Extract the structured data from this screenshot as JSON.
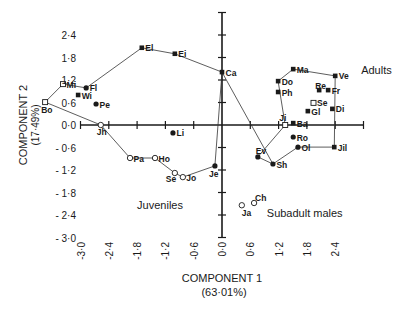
{
  "chart_data": {
    "type": "scatter",
    "title": "",
    "xlabel": "COMPONENT 1",
    "xlabel_sub": "(63·01%)",
    "ylabel": "COMPONENT 2",
    "ylabel_sub": "(17·49%)",
    "xlim": [
      -3.0,
      3.0
    ],
    "ylim": [
      -3.0,
      3.0
    ],
    "x_ticks": [
      -3.0,
      -2.4,
      -1.8,
      -1.2,
      -0.6,
      0.0,
      0.6,
      1.2,
      1.8,
      2.4
    ],
    "x_tick_labels": [
      "-3·0",
      "-2·4",
      "-1·8",
      "-1·2",
      "-0·6",
      "0·0",
      "0·6",
      "1·2",
      "1·8",
      "2·4"
    ],
    "y_ticks": [
      2.4,
      1.8,
      1.2,
      0.6,
      0.0,
      -0.6,
      -1.2,
      -1.8,
      -2.4,
      -3.0
    ],
    "y_tick_labels": [
      "2·4",
      "1·8",
      "1·2",
      "0·6",
      "0·0",
      "- 0·6",
      "- 1·2",
      "- 1·8",
      "- 2·4",
      "- 3·0"
    ],
    "grid": false,
    "legend": "none",
    "group_labels": [
      {
        "text": "Adults",
        "x": 2.95,
        "y": 1.35
      },
      {
        "text": "Juveniles",
        "x": -1.8,
        "y": -2.25
      },
      {
        "text": "Subadult males",
        "x": 0.95,
        "y": -2.45
      }
    ],
    "points": [
      {
        "label": "Bo",
        "x": -3.75,
        "y": 0.61,
        "marker": "open-square",
        "group": "Juveniles"
      },
      {
        "label": "Mi",
        "x": -3.37,
        "y": 1.09,
        "marker": "open-square",
        "group": "Adults"
      },
      {
        "label": "Fl",
        "x": -2.88,
        "y": 0.99,
        "marker": "filled-circle",
        "group": "Adults"
      },
      {
        "label": "Wi",
        "x": -3.05,
        "y": 0.8,
        "marker": "filled-square",
        "group": "Adults"
      },
      {
        "label": "Pe",
        "x": -2.67,
        "y": 0.56,
        "marker": "filled-circle",
        "group": "Adults"
      },
      {
        "label": "El",
        "x": -1.7,
        "y": 2.06,
        "marker": "filled-square",
        "group": "Adults"
      },
      {
        "label": "Ei",
        "x": -1.0,
        "y": 1.9,
        "marker": "filled-square",
        "group": "Adults"
      },
      {
        "label": "Ca",
        "x": 0.0,
        "y": 1.41,
        "marker": "filled-square",
        "group": "Adults"
      },
      {
        "label": "Jh",
        "x": -2.57,
        "y": 0.0,
        "marker": "open-circle",
        "group": "Juveniles"
      },
      {
        "label": "Li",
        "x": -1.04,
        "y": -0.21,
        "marker": "filled-circle",
        "group": "Juveniles"
      },
      {
        "label": "Pa",
        "x": -1.95,
        "y": -0.88,
        "marker": "open-circle",
        "group": "Juveniles"
      },
      {
        "label": "Ho",
        "x": -1.42,
        "y": -0.88,
        "marker": "open-circle",
        "group": "Juveniles"
      },
      {
        "label": "Se",
        "x": -1.0,
        "y": -1.28,
        "marker": "open-circle",
        "group": "Juveniles"
      },
      {
        "label": "Jo",
        "x": -0.83,
        "y": -1.39,
        "marker": "open-circle",
        "group": "Juveniles"
      },
      {
        "label": "Je",
        "x": -0.15,
        "y": -1.09,
        "marker": "filled-circle",
        "group": "Juveniles"
      },
      {
        "label": "Ma",
        "x": 1.51,
        "y": 1.49,
        "marker": "filled-square",
        "group": "Adults"
      },
      {
        "label": "Ve",
        "x": 2.4,
        "y": 1.31,
        "marker": "filled-square",
        "group": "Adults"
      },
      {
        "label": "Do",
        "x": 1.19,
        "y": 1.17,
        "marker": "filled-square",
        "group": "Adults"
      },
      {
        "label": "Ph",
        "x": 1.19,
        "y": 0.88,
        "marker": "filled-square",
        "group": "Adults"
      },
      {
        "label": "Re",
        "x": 2.06,
        "y": 0.93,
        "marker": "filled-square",
        "group": "Adults"
      },
      {
        "label": "Fr",
        "x": 2.25,
        "y": 0.93,
        "marker": "filled-square",
        "group": "Adults"
      },
      {
        "label": "Se",
        "x": 1.94,
        "y": 0.59,
        "marker": "open-square",
        "group": "Adults"
      },
      {
        "label": "Gl",
        "x": 1.82,
        "y": 0.37,
        "marker": "filled-square",
        "group": "Adults"
      },
      {
        "label": "Di",
        "x": 2.34,
        "y": 0.43,
        "marker": "filled-square",
        "group": "Adults"
      },
      {
        "label": "Ji",
        "x": 1.34,
        "y": 0.0,
        "marker": "open-square",
        "group": "Adults"
      },
      {
        "label": "Ba",
        "x": 1.51,
        "y": 0.05,
        "marker": "filled-square",
        "group": "Adults"
      },
      {
        "label": "Ro",
        "x": 1.51,
        "y": -0.32,
        "marker": "filled-circle",
        "group": "Adults"
      },
      {
        "label": "Ol",
        "x": 1.61,
        "y": -0.59,
        "marker": "filled-circle",
        "group": "Adults"
      },
      {
        "label": "Jil",
        "x": 2.38,
        "y": -0.59,
        "marker": "filled-square",
        "group": "Adults"
      },
      {
        "label": "Ev",
        "x": 0.76,
        "y": -0.85,
        "marker": "filled-circle",
        "group": "Adults"
      },
      {
        "label": "Sh",
        "x": 1.08,
        "y": -1.04,
        "marker": "filled-circle",
        "group": "Adults"
      },
      {
        "label": "Ja",
        "x": 0.42,
        "y": -2.14,
        "marker": "open-circle",
        "group": "Subadult males"
      },
      {
        "label": "Ch",
        "x": 0.68,
        "y": -2.08,
        "marker": "open-circle",
        "group": "Subadult males"
      }
    ],
    "hulls": [
      {
        "name": "adults-outline",
        "path": [
          "Mi",
          "Fl",
          "El",
          "Ei",
          "Ca",
          "Sh"
        ]
      },
      {
        "name": "left-outline",
        "path": [
          "Bo",
          "Mi"
        ]
      },
      {
        "name": "juveniles-outline",
        "path": [
          "Bo",
          "Jh",
          "Pa",
          "Ho",
          "Se",
          "Jo",
          "Je",
          "Ca"
        ]
      },
      {
        "name": "adults-right-outline",
        "path": [
          "Ji",
          "Do",
          "Ma",
          "Ve",
          "Jil",
          "Ol",
          "Sh",
          "Ev",
          "Ji"
        ]
      }
    ]
  }
}
